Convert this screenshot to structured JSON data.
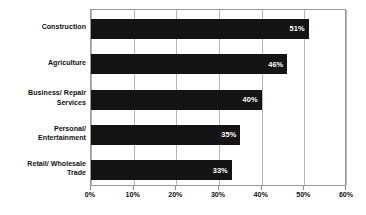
{
  "chart_data": {
    "type": "bar",
    "orientation": "horizontal",
    "title": "",
    "subtitle": "",
    "xlabel": "",
    "ylabel": "",
    "categories": [
      "Construction",
      "Agriculture",
      "Business/ Repair\nServices",
      "Personal/\nEntertainment",
      "Retail/ Wholesale\nTrade"
    ],
    "values": [
      51,
      46,
      40,
      35,
      33
    ],
    "data_labels": [
      "51%",
      "46%",
      "40%",
      "35%",
      "33%"
    ],
    "xlim": [
      0,
      60
    ],
    "xticks": [
      0,
      10,
      20,
      30,
      40,
      50,
      60
    ],
    "xtick_labels": [
      "0%",
      "10%",
      "20%",
      "30%",
      "40%",
      "50%",
      "60%"
    ],
    "grid": true,
    "grid_axis": "x",
    "legend": false,
    "legend_position": "none",
    "bar_color": "#141414",
    "data_label_color": "#ffffff",
    "axis_color": "#9a9a9a",
    "grid_color": "#b6b6b6",
    "text_color": "#111111",
    "background_color": "#ffffff"
  }
}
